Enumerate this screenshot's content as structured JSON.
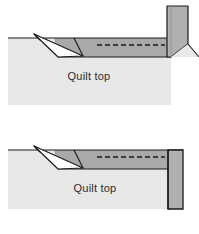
{
  "figure": {
    "panel_count": 2,
    "background_color": "#ffffff"
  },
  "palette": {
    "quilt_top_fill": "#e8e8e8",
    "binding_strip_fill": "#a9a9a9",
    "binding_band_fill": "#b0b0b0",
    "fold_triangle_fill": "#ffffff",
    "outline_color": "#1a1a1a",
    "stitch_color": "#1a1a1a",
    "text_color": "#2c2c2c"
  },
  "panels": [
    {
      "id": "panel-top",
      "name": "step-1-binding-folded-at-corner",
      "quilt_label": "Quilt top",
      "elements": {
        "quilt_top": "quilt-top-area",
        "binding_strip": "binding-strip-horizontal",
        "fold_triangle": "fold-triangle-left",
        "stitch_line": "dashed-stitch-line",
        "binding_band": "binding-band-vertical-angled"
      },
      "stitch": {
        "style": "dashed",
        "dash_pattern": "5,3",
        "segments": 13
      }
    },
    {
      "id": "panel-bottom",
      "name": "step-2-binding-band-straightened",
      "quilt_label": "Quilt top",
      "elements": {
        "quilt_top": "quilt-top-area",
        "binding_strip": "binding-strip-horizontal",
        "fold_triangle": "fold-triangle-left",
        "stitch_line": "dashed-stitch-line",
        "binding_band": "binding-band-vertical-full"
      },
      "stitch": {
        "style": "dashed",
        "dash_pattern": "5,3",
        "segments": 13
      }
    }
  ]
}
